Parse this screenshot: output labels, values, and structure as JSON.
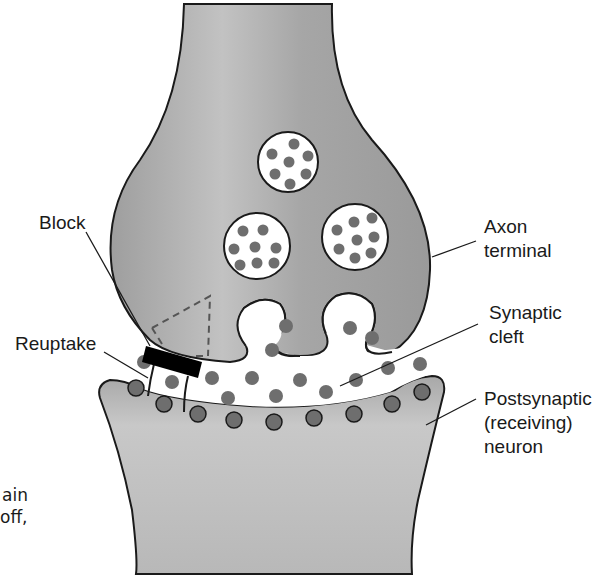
{
  "diagram": {
    "colors": {
      "neuron_fill": "#a9a9a9",
      "neuron_highlight": "#c4c4c4",
      "outline": "#1a1a1a",
      "neurotransmitter": "#6e6e6e",
      "cleft": "#ffffff",
      "block": "#000000"
    },
    "labels": {
      "block": "Block",
      "reuptake": "Reuptake",
      "axon_terminal_line1": "Axon",
      "axon_terminal_line2": "terminal",
      "synaptic_cleft_line1": "Synaptic",
      "synaptic_cleft_line2": "cleft",
      "postsynaptic_line1": "Postsynaptic",
      "postsynaptic_line2": "(receiving)",
      "postsynaptic_line3": "neuron"
    },
    "cut_off_text": {
      "line1": "ain",
      "line2": "off,"
    },
    "vesicles": [
      {
        "name": "vesicle-top",
        "dots": 7
      },
      {
        "name": "vesicle-left",
        "dots": 8
      },
      {
        "name": "vesicle-right",
        "dots": 8
      }
    ]
  }
}
